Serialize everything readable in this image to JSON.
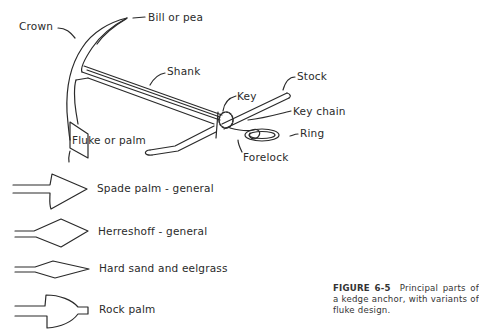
{
  "figure": {
    "id": "FIGURE 6-5",
    "caption_text": "Principal parts of a kedge anchor, with variants of fluke design."
  },
  "anchor_labels": {
    "crown": "Crown",
    "bill": "Bill or pea",
    "shank": "Shank",
    "stock": "Stock",
    "key": "Key",
    "key_chain": "Key chain",
    "ring": "Ring",
    "forelock": "Forelock",
    "fluke": "Fluke or palm"
  },
  "fluke_variants": [
    {
      "label": "Spade palm - general"
    },
    {
      "label": "Herreshoff - general"
    },
    {
      "label": "Hard sand and eelgrass"
    },
    {
      "label": "Rock palm"
    }
  ]
}
